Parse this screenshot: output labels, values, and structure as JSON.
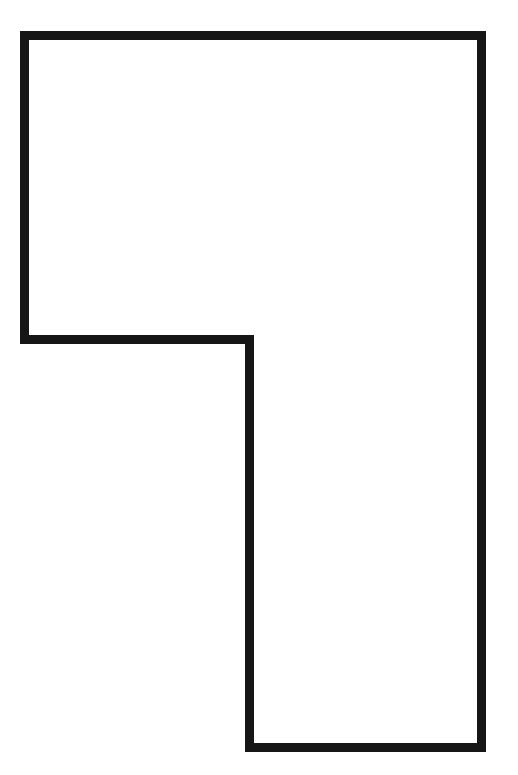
{
  "canvas": {
    "width": 518,
    "height": 775,
    "background_color": "#ffffff",
    "title": "Polygon outline figure"
  },
  "figure": {
    "name": "l-shaped-polygon",
    "stroke_color": "#161616",
    "fill_color": "none",
    "stroke_width": 9,
    "stroke_linejoin": "miter",
    "vertex_count": 6,
    "vertices": [
      {
        "label": "top-left",
        "x": 24.5,
        "y": 35.5
      },
      {
        "label": "top-right",
        "x": 481.5,
        "y": 35.5
      },
      {
        "label": "bottom-right",
        "x": 481.5,
        "y": 747.5
      },
      {
        "label": "bottom-left-of-leg",
        "x": 249.5,
        "y": 747.5
      },
      {
        "label": "inner-step-corner",
        "x": 249.5,
        "y": 339.5
      },
      {
        "label": "left-notch",
        "x": 24.5,
        "y": 339.5
      }
    ],
    "path": "M 24.5 35.5 L 481.5 35.5 L 481.5 747.5 L 249.5 747.5 L 249.5 339.5 L 24.5 339.5 Z",
    "bounding_box": {
      "x": 20,
      "y": 31,
      "width": 466,
      "height": 721
    }
  }
}
